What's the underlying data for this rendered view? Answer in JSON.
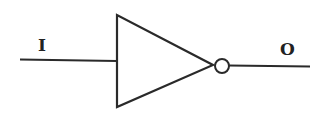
{
  "diagram": {
    "type": "logic-gate",
    "gate": "NOT",
    "input": {
      "label": "I"
    },
    "output": {
      "label": "O"
    },
    "colors": {
      "stroke": "#2a2a2a",
      "background": "#ffffff"
    }
  }
}
